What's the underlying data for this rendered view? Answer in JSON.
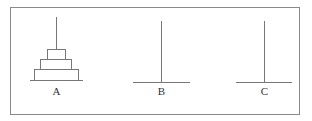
{
  "diagram": {
    "colors": {
      "stroke": "#777777",
      "frame": "#8a8a8a",
      "text": "#333333"
    },
    "frame": {
      "x": 10,
      "y": 7,
      "width": 289,
      "height": 107
    },
    "pegs": [
      {
        "label": "A",
        "x": 56,
        "top": 17,
        "base_y": 80,
        "base_x1": 30,
        "base_x2": 83,
        "label_y": 95,
        "disks": [
          {
            "x1": 34,
            "x2": 78,
            "y": 69
          },
          {
            "x1": 40,
            "x2": 71,
            "y": 59
          },
          {
            "x1": 47,
            "x2": 65,
            "y": 49
          }
        ]
      },
      {
        "label": "B",
        "x": 161,
        "top": 21,
        "base_y": 82,
        "base_x1": 133,
        "base_x2": 190,
        "label_y": 95,
        "disks": []
      },
      {
        "label": "C",
        "x": 264,
        "top": 21,
        "base_y": 82,
        "base_x1": 236,
        "base_x2": 292,
        "label_y": 95,
        "disks": []
      }
    ]
  }
}
